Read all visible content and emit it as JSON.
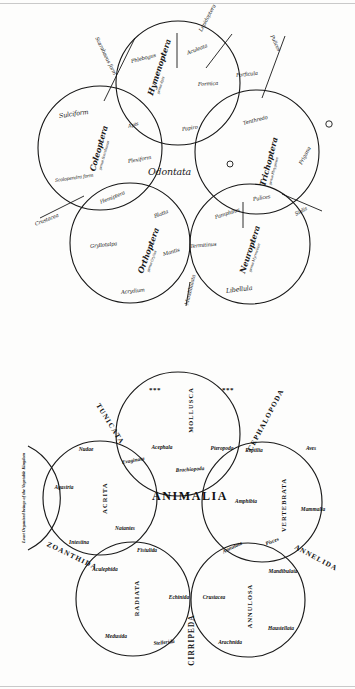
{
  "page": {
    "background": "#fdfdfc",
    "ink": "#101010",
    "rule_color": "#c9c9c9"
  },
  "odontata_diagram": {
    "center_label": "Odontata",
    "style": "handwritten manuscript, five overlapping circles",
    "circles": [
      {
        "id": "hymenoptera",
        "order": "Hymenoptera",
        "genus": "genus Apis",
        "members": [
          "Phlebogus",
          "Aculeata",
          "Formica",
          "Papiro"
        ]
      },
      {
        "id": "coleoptera",
        "order": "Coleoptera",
        "genus": "genus Scarabaeus",
        "members": [
          "Sulciform",
          "Apis",
          "Plexiform",
          "Scolopendra form"
        ]
      },
      {
        "id": "trichoptera",
        "order": "Trichoptera",
        "genus": "genus Phryganea",
        "members": [
          "Tenthredo",
          "Frigana",
          "Pulices"
        ]
      },
      {
        "id": "orthoptera",
        "order": "Orthoptera",
        "genus": "genus Gryllus",
        "members": [
          "Gryllotalpa",
          "Blatta",
          "Mantis",
          "Acrydium"
        ]
      },
      {
        "id": "neuroptera",
        "order": "Neuroptera",
        "genus": "genus Myrmeleon",
        "members": [
          "Pamphilus",
          "Sialis",
          "Termitinus",
          "Libellula"
        ]
      }
    ],
    "outer_annotations": [
      "Scarabaeus form",
      "Lepidoptera",
      "Pulices",
      "Forficula",
      "Hemiptera",
      "Mandibulata",
      "Crustacea"
    ]
  },
  "animalia_diagram": {
    "title": "ANIMALIA",
    "style": "printed quinarian system, five overlapping circles",
    "circles": [
      {
        "id": "mollusca",
        "name": "MOLLUSCA",
        "members": [
          "Acephala",
          "Pteropoda",
          "Brachiopoda"
        ],
        "markers": [
          "***",
          "***"
        ]
      },
      {
        "id": "acrita",
        "name": "ACRITA",
        "members": [
          "Nudae",
          "Agastria",
          "Intestina",
          "Natantes",
          "Evaginata"
        ]
      },
      {
        "id": "vertebrata",
        "name": "VERTEBRATA",
        "members": [
          "Reptilia",
          "Aves",
          "Amphibia",
          "Mammalia",
          "Pisces"
        ]
      },
      {
        "id": "radiata",
        "name": "RADIATA",
        "members": [
          "Fistulida",
          "Aculephida",
          "Medusida",
          "Stellerida",
          "Echinida"
        ]
      },
      {
        "id": "annulosa",
        "name": "ANNULOSA",
        "members": [
          "Crustacea",
          "Mandibulata",
          "Haustellata",
          "Arachnida",
          "Annulata"
        ]
      }
    ],
    "junction_labels": [
      "TUNICATA",
      "CEPHALOPODA",
      "ANNELIDA",
      "CIRRIPEDA",
      "ZOANTHIDA"
    ],
    "side_note": "Least Organized beings of the Vegetable Kingdom"
  }
}
